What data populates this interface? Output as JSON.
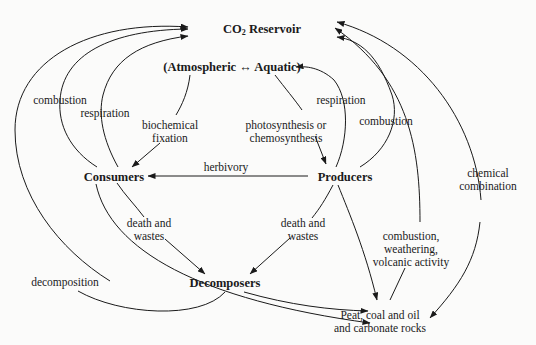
{
  "nodes": {
    "co2_reservoir": "CO",
    "co2_sub": "2",
    "co2_reservoir_rest": " Reservoir",
    "atmospheric_aquatic": "(Atmospheric ↔ Aquatic)",
    "consumers": "Consumers",
    "producers": "Producers",
    "decomposers": "Decomposers",
    "fossil_line1": "Peat, coal and oil",
    "fossil_line2": "and carbonate rocks"
  },
  "edge_labels": {
    "combustion_left": "combustion",
    "respiration_left": "respiration",
    "biochemical_1": "biochemical",
    "biochemical_2": "fixation",
    "photosynthesis_1": "photosynthesis or",
    "photosynthesis_2": "chemosynthesis",
    "respiration_right": "respiration",
    "combustion_right": "combustion",
    "herbivory": "herbivory",
    "chemical_1": "chemical",
    "chemical_2": "combination",
    "death_left_1": "death and",
    "death_left_2": "wastes",
    "death_right_1": "death and",
    "death_right_2": "wastes",
    "cwv_1": "combustion,",
    "cwv_2": "weathering,",
    "cwv_3": "volcanic activity",
    "decomposition": "decomposition"
  },
  "colors": {
    "background": "#fbfbfa",
    "line": "#1a1a1a"
  }
}
